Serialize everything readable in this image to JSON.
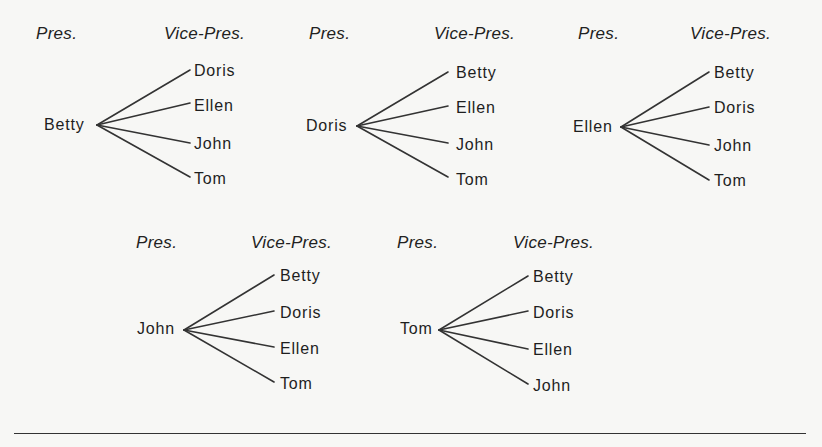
{
  "diagram": {
    "type": "tree-diagram",
    "header_left": "Pres.",
    "header_right": "Vice-Pres.",
    "trees": [
      {
        "pres": "Betty",
        "header_left": "Pres.",
        "header_right": "Vice-Pres.",
        "vice_pres": [
          "Doris",
          "Ellen",
          "John",
          "Tom"
        ]
      },
      {
        "pres": "Doris",
        "header_left": "Pres.",
        "header_right": "Vice-Pres.",
        "vice_pres": [
          "Betty",
          "Ellen",
          "John",
          "Tom"
        ]
      },
      {
        "pres": "Ellen",
        "header_left": "Pres.",
        "header_right": "Vice-Pres.",
        "vice_pres": [
          "Betty",
          "Doris",
          "John",
          "Tom"
        ]
      },
      {
        "pres": "John",
        "header_left": "Pres.",
        "header_right": "Vice-Pres.",
        "vice_pres": [
          "Betty",
          "Doris",
          "Ellen",
          "Tom"
        ]
      },
      {
        "pres": "Tom",
        "header_left": "Pres.",
        "header_right": "Vice-Pres.",
        "vice_pres": [
          "Betty",
          "Doris",
          "Ellen",
          "John"
        ]
      }
    ],
    "colors": {
      "line": "#333333",
      "text": "#222222",
      "background": "#f7f7f5"
    }
  }
}
